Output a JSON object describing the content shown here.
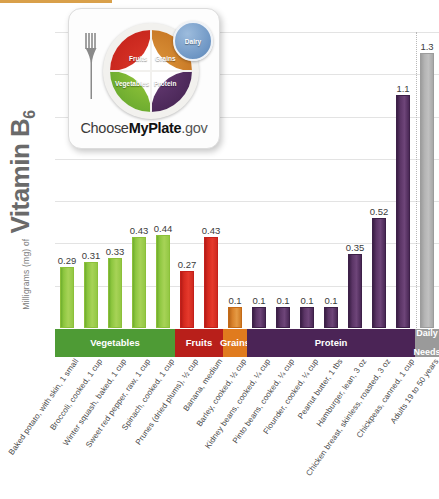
{
  "yaxis": {
    "units": "Milligrams (mg) of",
    "nutrient": "Vitamin B",
    "subscript": "6"
  },
  "bands": [
    {
      "key": "vegetables",
      "label": "Vegetables",
      "color": "#4e9b35"
    },
    {
      "key": "fruits",
      "label": "Fruits",
      "color": "#b81f1a"
    },
    {
      "key": "grains",
      "label": "Grains",
      "color": "#e07b1e"
    },
    {
      "key": "protein",
      "label": "Protein",
      "color": "#4b2456"
    },
    {
      "key": "daily",
      "label": "Daily\nNeeds",
      "color": "#9a9a9a"
    }
  ],
  "logo": {
    "brand_prefix": "Choose",
    "brand_bold": "MyPlate",
    "brand_suffix": ".gov",
    "fruits": "Fruits",
    "grains": "Grains",
    "vegetables": "Vegetables",
    "protein": "Protein",
    "dairy": "Dairy"
  },
  "chart_data": {
    "type": "bar",
    "title": "Vitamin B6",
    "xlabel": "",
    "ylabel": "Milligrams (mg) of Vitamin B6",
    "ylim": [
      0,
      1.4
    ],
    "grid": true,
    "gridlines": [
      0.2,
      0.4,
      0.6,
      0.8,
      1.0,
      1.2,
      1.4
    ],
    "legend": "none",
    "categories": [
      "Baked potato, with skin, 1 small",
      "Broccoli, cooked, 1 cup",
      "Winter squash, baked, 1 cup",
      "Sweet red pepper, raw, 1 cup",
      "Spinach, cooked, 1 cup",
      "Prunes (dried plums), ½ cup",
      "Banana, medium",
      "Barley, cooked, ½ cup",
      "Kidney beans, cooked, ¼ cup",
      "Pinto beans, cooked, ¼ cup",
      "Flounder, cooked, ¼ cup",
      "Peanut butter, 1 tbs",
      "Hamburger, lean, 3 oz",
      "Chicken breast, skinless, roasted, 3 oz",
      "Chickpeas, canned, 1 cup",
      "Adults 19 to 50 years"
    ],
    "values": [
      0.29,
      0.31,
      0.33,
      0.43,
      0.44,
      0.27,
      0.43,
      0.1,
      0.1,
      0.1,
      0.1,
      0.1,
      0.35,
      0.52,
      1.1,
      1.3
    ],
    "value_labels": [
      "0.29",
      "0.31",
      "0.33",
      "0.43",
      "0.44",
      "0.27",
      "0.43",
      "0.1",
      "0.1",
      "0.1",
      "0.1",
      "0.1",
      "0.35",
      "0.52",
      "1.1",
      "1.3"
    ],
    "groups": [
      "vegetables",
      "vegetables",
      "vegetables",
      "vegetables",
      "vegetables",
      "fruits",
      "fruits",
      "grains",
      "protein",
      "protein",
      "protein",
      "protein",
      "protein",
      "protein",
      "protein",
      "daily"
    ],
    "colors": {
      "vegetables": "#8dc63f",
      "fruits": "#d62a1f",
      "grains": "#d9822b",
      "protein": "#5b3566",
      "daily": "#b4b4b4"
    }
  }
}
